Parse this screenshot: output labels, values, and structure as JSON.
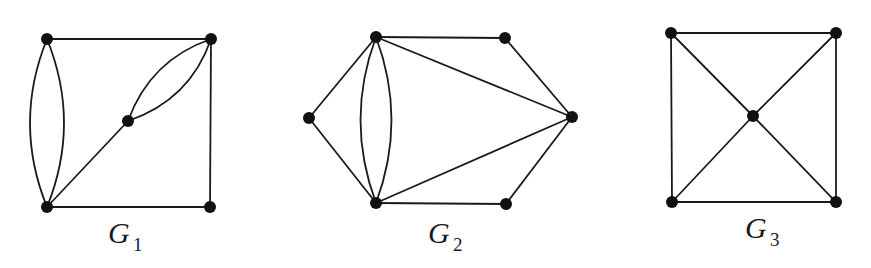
{
  "graphs": [
    {
      "name": "G",
      "subscript": "1",
      "nodes": [
        {
          "id": "a",
          "x": 47,
          "y": 39
        },
        {
          "id": "b",
          "x": 211,
          "y": 39
        },
        {
          "id": "c",
          "x": 128,
          "y": 121
        },
        {
          "id": "d",
          "x": 47,
          "y": 207
        },
        {
          "id": "e",
          "x": 210,
          "y": 207
        }
      ],
      "edges": [
        [
          "a",
          "b"
        ],
        [
          "a",
          "d",
          "curve-left"
        ],
        [
          "a",
          "d",
          "curve-right"
        ],
        [
          "b",
          "c",
          "curve-up"
        ],
        [
          "b",
          "c",
          "curve-down"
        ],
        [
          "c",
          "d"
        ],
        [
          "b",
          "e"
        ],
        [
          "d",
          "e"
        ]
      ]
    },
    {
      "name": "G",
      "subscript": "2",
      "nodes": [
        {
          "id": "a",
          "x": 376,
          "y": 37
        },
        {
          "id": "b",
          "x": 505,
          "y": 38
        },
        {
          "id": "c",
          "x": 309,
          "y": 118
        },
        {
          "id": "d",
          "x": 572,
          "y": 117
        },
        {
          "id": "e",
          "x": 376,
          "y": 203
        },
        {
          "id": "f",
          "x": 506,
          "y": 204
        }
      ],
      "edges": [
        [
          "a",
          "b"
        ],
        [
          "b",
          "d"
        ],
        [
          "a",
          "d"
        ],
        [
          "c",
          "a"
        ],
        [
          "c",
          "e"
        ],
        [
          "a",
          "e",
          "curve-left"
        ],
        [
          "a",
          "e",
          "curve-right"
        ],
        [
          "e",
          "d"
        ],
        [
          "e",
          "f"
        ],
        [
          "f",
          "d"
        ]
      ]
    },
    {
      "name": "G",
      "subscript": "3",
      "nodes": [
        {
          "id": "a",
          "x": 671,
          "y": 33
        },
        {
          "id": "b",
          "x": 836,
          "y": 33
        },
        {
          "id": "c",
          "x": 753,
          "y": 116
        },
        {
          "id": "d",
          "x": 672,
          "y": 202
        },
        {
          "id": "e",
          "x": 836,
          "y": 202
        }
      ],
      "edges": [
        [
          "a",
          "b"
        ],
        [
          "b",
          "e"
        ],
        [
          "e",
          "d"
        ],
        [
          "d",
          "a"
        ],
        [
          "a",
          "c"
        ],
        [
          "b",
          "c"
        ],
        [
          "d",
          "c"
        ],
        [
          "e",
          "c"
        ]
      ]
    }
  ],
  "labels": {
    "g1": {
      "name": "G",
      "sub": "1"
    },
    "g2": {
      "name": "G",
      "sub": "2"
    },
    "g3": {
      "name": "G",
      "sub": "3"
    }
  }
}
